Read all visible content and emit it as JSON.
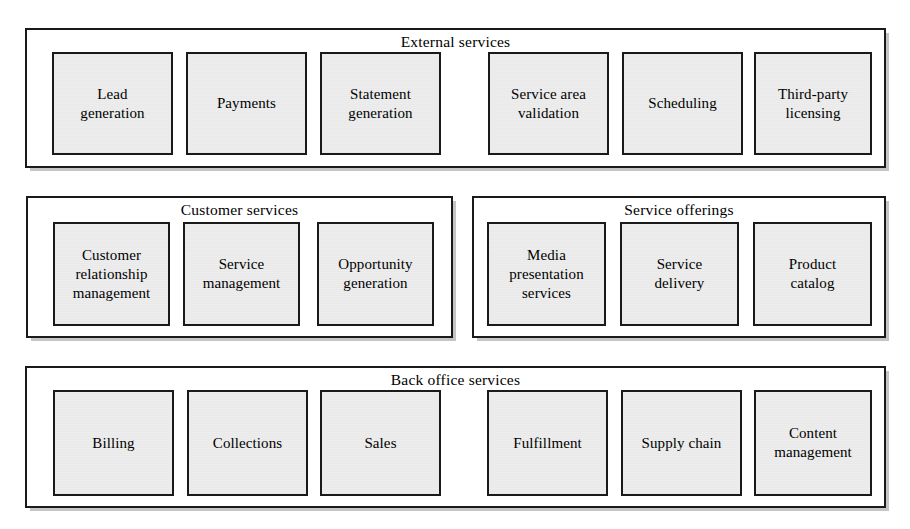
{
  "diagram": {
    "width": 910,
    "height": 529,
    "background_color": "#ffffff",
    "box_fill_color": "#ededed",
    "border_color": "#1a1a1a",
    "groups": [
      {
        "id": "external-services",
        "title": "External services",
        "rect": {
          "x": 25,
          "y": 28,
          "w": 861,
          "h": 140
        },
        "boxes": [
          {
            "id": "lead-generation",
            "label": "Lead\ngeneration",
            "rect": {
              "x": 52,
              "y": 52,
              "w": 121,
              "h": 103
            }
          },
          {
            "id": "payments",
            "label": "Payments",
            "rect": {
              "x": 186,
              "y": 52,
              "w": 121,
              "h": 103
            }
          },
          {
            "id": "statement-generation",
            "label": "Statement\ngeneration",
            "rect": {
              "x": 320,
              "y": 52,
              "w": 121,
              "h": 103
            }
          },
          {
            "id": "service-area-validation",
            "label": "Service area\nvalidation",
            "rect": {
              "x": 488,
              "y": 52,
              "w": 121,
              "h": 103
            }
          },
          {
            "id": "scheduling",
            "label": "Scheduling",
            "rect": {
              "x": 622,
              "y": 52,
              "w": 121,
              "h": 103
            }
          },
          {
            "id": "third-party-licensing",
            "label": "Third-party\nlicensing",
            "rect": {
              "x": 754,
              "y": 52,
              "w": 118,
              "h": 103
            }
          }
        ]
      },
      {
        "id": "customer-services",
        "title": "Customer services",
        "rect": {
          "x": 26,
          "y": 196,
          "w": 427,
          "h": 142
        },
        "boxes": [
          {
            "id": "customer-relationship-management",
            "label": "Customer\nrelationship\nmanagement",
            "rect": {
              "x": 53,
              "y": 222,
              "w": 117,
              "h": 104
            }
          },
          {
            "id": "service-management",
            "label": "Service\nmanagement",
            "rect": {
              "x": 183,
              "y": 222,
              "w": 117,
              "h": 104
            }
          },
          {
            "id": "opportunity-generation",
            "label": "Opportunity\ngeneration",
            "rect": {
              "x": 317,
              "y": 222,
              "w": 117,
              "h": 104
            }
          }
        ]
      },
      {
        "id": "service-offerings",
        "title": "Service offerings",
        "rect": {
          "x": 472,
          "y": 196,
          "w": 414,
          "h": 142
        },
        "boxes": [
          {
            "id": "media-presentation-services",
            "label": "Media\npresentation\nservices",
            "rect": {
              "x": 487,
              "y": 222,
              "w": 119,
              "h": 104
            }
          },
          {
            "id": "service-delivery",
            "label": "Service\ndelivery",
            "rect": {
              "x": 620,
              "y": 222,
              "w": 119,
              "h": 104
            }
          },
          {
            "id": "product-catalog",
            "label": "Product\ncatalog",
            "rect": {
              "x": 753,
              "y": 222,
              "w": 119,
              "h": 104
            }
          }
        ]
      },
      {
        "id": "back-office-services",
        "title": "Back office services",
        "rect": {
          "x": 25,
          "y": 366,
          "w": 861,
          "h": 142
        },
        "boxes": [
          {
            "id": "billing",
            "label": "Billing",
            "rect": {
              "x": 53,
              "y": 390,
              "w": 121,
              "h": 106
            }
          },
          {
            "id": "collections",
            "label": "Collections",
            "rect": {
              "x": 187,
              "y": 390,
              "w": 121,
              "h": 106
            }
          },
          {
            "id": "sales",
            "label": "Sales",
            "rect": {
              "x": 320,
              "y": 390,
              "w": 121,
              "h": 106
            }
          },
          {
            "id": "fulfillment",
            "label": "Fulfillment",
            "rect": {
              "x": 487,
              "y": 390,
              "w": 121,
              "h": 106
            }
          },
          {
            "id": "supply-chain",
            "label": "Supply chain",
            "rect": {
              "x": 621,
              "y": 390,
              "w": 121,
              "h": 106
            }
          },
          {
            "id": "content-management",
            "label": "Content\nmanagement",
            "rect": {
              "x": 754,
              "y": 390,
              "w": 118,
              "h": 106
            }
          }
        ]
      }
    ]
  }
}
